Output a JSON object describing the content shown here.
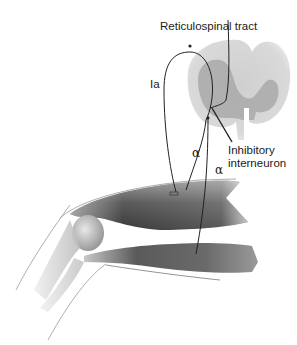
{
  "diagram": {
    "labels": {
      "reticulospinal_tract": "Reticulospinal tract",
      "ia_afferent": "Ia",
      "alpha_motor_1": "α",
      "alpha_motor_2": "α",
      "inhibitory_interneuron_line1": "Inhibitory",
      "inhibitory_interneuron_line2": "interneuron"
    },
    "colors": {
      "background": "#ffffff",
      "spinal_cord_light": "#d6d6d6",
      "spinal_cord_gray_matter": "#a8a8a8",
      "muscle_dark": "#4a4a4a",
      "muscle_light": "#b8b8b8",
      "nerve_line": "#222222"
    }
  }
}
